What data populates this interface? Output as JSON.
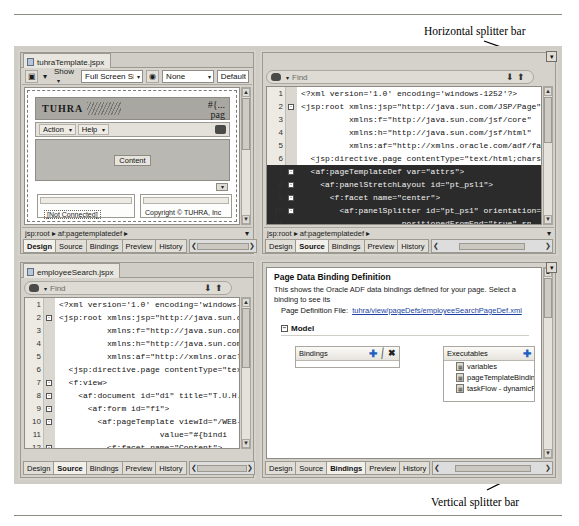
{
  "annotations": {
    "horizontal_splitter": "Horizontal splitter bar",
    "vertical_splitter": "Vertical splitter bar"
  },
  "view_tabs": [
    "Design",
    "Source",
    "Bindings",
    "Preview",
    "History"
  ],
  "panels": {
    "top_left": {
      "tab_label": "tuhraTemplate.jspx",
      "active_view_tab": "Design",
      "toolbar": {
        "screen_size_label": "Full Screen Size",
        "show_label": "Show",
        "none_label": "None",
        "default_label": "Default"
      },
      "breadcrumb": "jsp:root  ▸  af:pagetemplatedef  ▸",
      "design": {
        "brand": "TUHRA",
        "el_expression": "#{...",
        "el_expression2": "pag",
        "menu_action": "Action",
        "menu_help": "Help",
        "content_label": "Content",
        "not_connected": "[Not Connected]",
        "copyright": "Copyright © TUHRA, Inc"
      }
    },
    "top_right": {
      "active_view_tab": "Source",
      "find_placeholder": "Find",
      "breadcrumb": "jsp:root  ▸  af:pagetemplatedef  ▸",
      "code_lines": [
        {
          "n": "1",
          "fold": "",
          "sel": false,
          "text": "<?xml version='1.0' encoding='windows-1252'?>"
        },
        {
          "n": "2",
          "fold": "-",
          "sel": false,
          "text": "<jsp:root xmlns:jsp=\"http://java.sun.com/JSP/Page\" ve"
        },
        {
          "n": "3",
          "fold": "",
          "sel": false,
          "text": "          xmlns:f=\"http://java.sun.com/jsf/core\""
        },
        {
          "n": "4",
          "fold": "",
          "sel": false,
          "text": "          xmlns:h=\"http://java.sun.com/jsf/html\""
        },
        {
          "n": "5",
          "fold": "",
          "sel": false,
          "text": "          xmlns:af=\"http://xmlns.oracle.com/adf/faces"
        },
        {
          "n": "6",
          "fold": "",
          "sel": false,
          "text": "  <jsp:directive.page contentType=\"text/html;charset="
        },
        {
          "n": "7",
          "fold": "-",
          "sel": true,
          "text": "  <af:pageTemplateDef var=\"attrs\">"
        },
        {
          "n": "8",
          "fold": "-",
          "sel": true,
          "text": "    <af:panelStretchLayout id=\"pt_psl1\">"
        },
        {
          "n": "9",
          "fold": "-",
          "sel": true,
          "text": "      <f:facet name=\"center\">"
        },
        {
          "n": "10",
          "fold": "-",
          "sel": true,
          "text": "        <af:panelSplitter id=\"pt_ps1\" orientation=\"ve"
        },
        {
          "n": "11",
          "fold": "",
          "sel": true,
          "text": "                     positionedFromEnd=\"true\" sp"
        },
        {
          "n": "12",
          "fold": "-",
          "sel": true,
          "text": "          <f:facet name=\"first\">"
        },
        {
          "n": "13",
          "fold": "-",
          "sel": true,
          "text": "            <af:decorativeBox id=\"pt_db2\" theme=\"ligh"
        },
        {
          "n": "14",
          "fold": "-",
          "sel": true,
          "text": "              <f:facet name=\"center\">"
        },
        {
          "n": "15",
          "fold": "",
          "sel": true,
          "text": "                <af:facetRef facetName=\"Content\"/>"
        }
      ]
    },
    "bottom_left": {
      "tab_label": "employeeSearch.jspx",
      "active_view_tab": "Source",
      "find_placeholder": "Find",
      "code_lines": [
        {
          "n": "1",
          "fold": "",
          "sel": false,
          "text": "<?xml version='1.0' encoding='windows-1"
        },
        {
          "n": "2",
          "fold": "-",
          "sel": false,
          "text": "<jsp:root xmlns:jsp=\"http://java.sun.co"
        },
        {
          "n": "3",
          "fold": "",
          "sel": false,
          "text": "          xmlns:f=\"http://java.sun.com/"
        },
        {
          "n": "4",
          "fold": "",
          "sel": false,
          "text": "          xmlns:h=\"http://java.sun.com/"
        },
        {
          "n": "5",
          "fold": "",
          "sel": false,
          "text": "          xmlns:af=\"http://xmlns.oracle"
        },
        {
          "n": "6",
          "fold": "",
          "sel": false,
          "text": "  <jsp:directive.page contentType=\"text"
        },
        {
          "n": "7",
          "fold": "-",
          "sel": false,
          "text": "  <f:view>"
        },
        {
          "n": "8",
          "fold": "-",
          "sel": false,
          "text": "    <af:document id=\"d1\" title=\"T.U.H.R"
        },
        {
          "n": "9",
          "fold": "-",
          "sel": false,
          "text": "      <af:form id=\"f1\">"
        },
        {
          "n": "10",
          "fold": "-",
          "sel": false,
          "text": "        <af:pageTemplate viewId=\"/WEB-I"
        },
        {
          "n": "11",
          "fold": "",
          "sel": false,
          "text": "                     value=\"#{bindi"
        },
        {
          "n": "12",
          "fold": "-",
          "sel": false,
          "text": "          <f:facet name=\"Content\">"
        },
        {
          "n": "13",
          "fold": "-",
          "sel": false,
          "text": "            <af:panelSplitter id=\"ps1\""
        },
        {
          "n": "14",
          "fold": "",
          "sel": false,
          "text": "                      orientati"
        },
        {
          "n": "15",
          "fold": "-",
          "sel": false,
          "text": "              <f:facet name=\"first\">"
        }
      ]
    },
    "bottom_right": {
      "active_view_tab": "Bindings",
      "title": "Page Data Binding Definition",
      "description": "This shows the Oracle ADF data bindings defined for your page. Select a binding to see its",
      "page_def_label": "Page Definition File:",
      "page_def_value": "tuhra/view/pageDefs/employeeSearchPageDef.xml",
      "model_label": "Model",
      "bindings_box": {
        "title": "Bindings",
        "add_icon": "plus-icon",
        "edit_icon": "pencil-icon",
        "delete_icon": "x-icon",
        "items": []
      },
      "executables_box": {
        "title": "Executables",
        "add_icon": "plus-icon",
        "items": [
          "variables",
          "pageTemplateBinding",
          "taskFlow - dynamicR"
        ]
      }
    }
  }
}
